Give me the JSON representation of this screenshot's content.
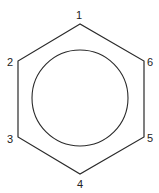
{
  "diagram": {
    "stroke_color": "#2a2a2a",
    "vertices": [
      {
        "label": "1",
        "x": 80,
        "y": 24,
        "label_x": 79,
        "label_y": 19
      },
      {
        "label": "2",
        "x": 18,
        "y": 61,
        "label_x": 10,
        "label_y": 66
      },
      {
        "label": "3",
        "x": 18,
        "y": 137,
        "label_x": 10,
        "label_y": 143
      },
      {
        "label": "4",
        "x": 80,
        "y": 174,
        "label_x": 80,
        "label_y": 188
      },
      {
        "label": "5",
        "x": 144,
        "y": 137,
        "label_x": 150,
        "label_y": 142
      },
      {
        "label": "6",
        "x": 144,
        "y": 61,
        "label_x": 150,
        "label_y": 66
      }
    ],
    "circle": {
      "cx": 80,
      "cy": 98,
      "r": 48
    }
  }
}
